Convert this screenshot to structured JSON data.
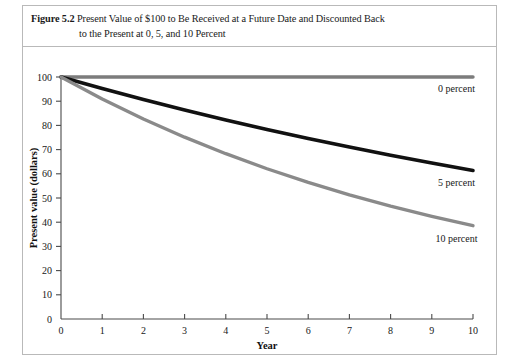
{
  "figure": {
    "number_label": "Figure 5.2",
    "caption_line_1": "Present Value of $100 to Be Received at a Future Date and Discounted Back",
    "caption_line_2": "to the Present at 0, 5, and 10 Percent"
  },
  "axis": {
    "y_title": "Present value (dollars)",
    "x_title": "Year",
    "y_ticks": [
      "0",
      "10",
      "20",
      "30",
      "40",
      "50",
      "60",
      "70",
      "80",
      "90",
      "100"
    ],
    "x_ticks": [
      "0",
      "1",
      "2",
      "3",
      "4",
      "5",
      "6",
      "7",
      "8",
      "9",
      "10"
    ]
  },
  "series_labels": {
    "zero": "0 percent",
    "five": "5 percent",
    "ten": "10 percent"
  },
  "colors": {
    "zero_percent": "#7c7c7c",
    "five_percent": "#111111",
    "ten_percent": "#8a8a8a",
    "axis": "#4a4a4a",
    "frame": "#b9b9b9",
    "text": "#171717"
  },
  "chart_data": {
    "type": "line",
    "title": "Present Value of $100 to Be Received at a Future Date and Discounted Back to the Present at 0, 5, and 10 Percent",
    "xlabel": "Year",
    "ylabel": "Present value (dollars)",
    "xlim": [
      0,
      10
    ],
    "ylim": [
      0,
      100
    ],
    "xticks": [
      0,
      1,
      2,
      3,
      4,
      5,
      6,
      7,
      8,
      9,
      10
    ],
    "yticks": [
      0,
      10,
      20,
      30,
      40,
      50,
      60,
      70,
      80,
      90,
      100
    ],
    "grid": false,
    "legend": "inline-right-of-curve",
    "x": [
      0,
      1,
      2,
      3,
      4,
      5,
      6,
      7,
      8,
      9,
      10
    ],
    "series": [
      {
        "name": "0 percent",
        "color": "#7c7c7c",
        "values": [
          100,
          100,
          100,
          100,
          100,
          100,
          100,
          100,
          100,
          100,
          100
        ]
      },
      {
        "name": "5 percent",
        "color": "#111111",
        "values": [
          100,
          95.24,
          90.7,
          86.38,
          82.27,
          78.35,
          74.62,
          71.07,
          67.68,
          64.46,
          61.39
        ]
      },
      {
        "name": "10 percent",
        "color": "#8a8a8a",
        "values": [
          100,
          90.91,
          82.64,
          75.13,
          68.3,
          62.09,
          56.45,
          51.32,
          46.65,
          42.41,
          38.55
        ]
      }
    ],
    "annotations": [
      {
        "text": "0 percent",
        "x": 9.6,
        "y": 94
      },
      {
        "text": "5 percent",
        "x": 9.6,
        "y": 55
      },
      {
        "text": "10 percent",
        "x": 9.6,
        "y": 32
      }
    ]
  }
}
